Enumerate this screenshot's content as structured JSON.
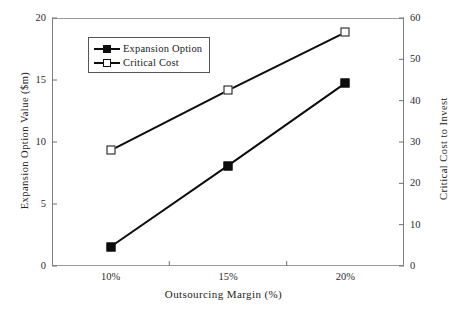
{
  "chart_data": {
    "type": "line",
    "title": "",
    "xlabel": "Outsourcing Margin (%)",
    "ylabel": "Expansion Option Value ($m)",
    "y2label": "Critical Cost to Invest",
    "categories": [
      "10%",
      "15%",
      "20%"
    ],
    "xlim": [
      0,
      3
    ],
    "ylim": [
      0,
      20
    ],
    "y2lim": [
      0,
      60
    ],
    "yticks": [
      "0",
      "5",
      "10",
      "15",
      "20"
    ],
    "ytick_values": [
      0,
      5,
      10,
      15,
      20
    ],
    "y2ticks": [
      "0",
      "10",
      "20",
      "30",
      "40",
      "50",
      "60"
    ],
    "y2tick_values": [
      0,
      10,
      20,
      30,
      40,
      50,
      60
    ],
    "grid": false,
    "legend_position": "upper-left-inside",
    "series": [
      {
        "name": "Expansion Option",
        "axis": "left",
        "marker": "filled-square",
        "color": "#0d0d0d",
        "values": [
          1.55,
          8.1,
          14.75
        ]
      },
      {
        "name": "Critical Cost",
        "axis": "right",
        "marker": "open-square",
        "color": "#0d0d0d",
        "values": [
          28.0,
          42.5,
          56.5
        ]
      }
    ]
  },
  "legend": {
    "items": [
      {
        "label": "Expansion Option",
        "marker": "filled-square"
      },
      {
        "label": "Critical Cost",
        "marker": "open-square"
      }
    ]
  },
  "colors": {
    "line": "#0d0d0d",
    "frame": "#7d7d7d",
    "text": "#1a1a1a",
    "background": "#ffffff"
  }
}
